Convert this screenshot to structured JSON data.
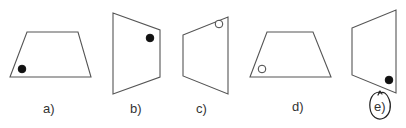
{
  "options": [
    {
      "label": "a)",
      "shape": "trapezoid",
      "points": "27,32 78,32 91,77 10,77",
      "marker": {
        "type": "filled",
        "cx": 22,
        "cy": 69,
        "r": 3.8
      },
      "label_pos": {
        "x": 43,
        "y": 113
      }
    },
    {
      "label": "b)",
      "shape": "quadrilateral",
      "points": "113,13 160,30 160,77 113,94",
      "marker": {
        "type": "filled",
        "cx": 150,
        "cy": 38,
        "r": 3.8
      },
      "label_pos": {
        "x": 130,
        "y": 113
      }
    },
    {
      "label": "c)",
      "shape": "quadrilateral",
      "points": "183,35 228,17 228,94 183,76",
      "marker": {
        "type": "hollow",
        "cx": 219,
        "cy": 24,
        "r": 3.8
      },
      "label_pos": {
        "x": 196,
        "y": 113
      }
    },
    {
      "label": "d)",
      "shape": "trapezoid",
      "points": "267,32 313,32 331,77 250,77",
      "marker": {
        "type": "hollow",
        "cx": 262,
        "cy": 69,
        "r": 3.8
      },
      "label_pos": {
        "x": 292,
        "y": 111
      }
    },
    {
      "label": "e)",
      "shape": "quadrilateral",
      "points": "352,28 396,10 396,93 352,75",
      "marker": {
        "type": "filled",
        "cx": 389,
        "cy": 80,
        "r": 3.8
      },
      "label_pos": {
        "x": 374,
        "y": 111
      },
      "annotated": true
    }
  ],
  "selected_answer": "e)"
}
